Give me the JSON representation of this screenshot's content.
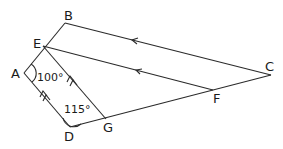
{
  "diagram": {
    "type": "geometry",
    "points": {
      "A": {
        "label": "A",
        "x": 24,
        "y": 73
      },
      "B": {
        "label": "B",
        "x": 65,
        "y": 23
      },
      "C": {
        "label": "C",
        "x": 271,
        "y": 75
      },
      "D": {
        "label": "D",
        "x": 70,
        "y": 127
      },
      "E": {
        "label": "E",
        "x": 43,
        "y": 46
      },
      "F": {
        "label": "F",
        "x": 213,
        "y": 90
      },
      "G": {
        "label": "G",
        "x": 106,
        "y": 119
      }
    },
    "angles": {
      "A": "100°",
      "D": "115°"
    },
    "parallel_sets": [
      {
        "segments": [
          "BC",
          "EF"
        ],
        "marker": "single arrow"
      },
      {
        "segments": [
          "DA",
          "GE"
        ],
        "marker": "double arrow"
      }
    ]
  }
}
